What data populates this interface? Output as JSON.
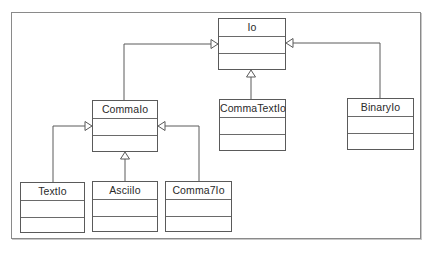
{
  "diagram": {
    "type": "uml-class-diagram",
    "frame": {
      "x": 11,
      "y": 12,
      "width": 410,
      "height": 227
    },
    "colors": {
      "line": "#5a5a5a",
      "frame": "#8a8a8a",
      "text": "#2a2a2a",
      "background": "#ffffff"
    },
    "classes": [
      {
        "id": "io",
        "name": "Io",
        "x": 218,
        "y": 18,
        "w": 68,
        "h": 52
      },
      {
        "id": "commaio",
        "name": "CommaIo",
        "x": 92,
        "y": 100,
        "w": 66,
        "h": 52
      },
      {
        "id": "commatextio",
        "name": "CommaTextIo",
        "x": 219,
        "y": 99,
        "w": 67,
        "h": 52
      },
      {
        "id": "binaryio",
        "name": "BinaryIo",
        "x": 347,
        "y": 98,
        "w": 67,
        "h": 52
      },
      {
        "id": "textio",
        "name": "TextIo",
        "x": 20,
        "y": 182,
        "w": 65,
        "h": 51
      },
      {
        "id": "asciiio",
        "name": "AsciiIo",
        "x": 92,
        "y": 181,
        "w": 66,
        "h": 51
      },
      {
        "id": "comma7io",
        "name": "Comma7Io",
        "x": 165,
        "y": 181,
        "w": 67,
        "h": 51
      }
    ],
    "generalizations": [
      {
        "child": "CommaIo",
        "parent": "Io",
        "points": [
          [
            124,
            100
          ],
          [
            124,
            44
          ],
          [
            218,
            44
          ]
        ],
        "arrow_dir": "right"
      },
      {
        "child": "CommaTextIo",
        "parent": "Io",
        "points": [
          [
            251,
            99
          ],
          [
            251,
            70
          ]
        ],
        "arrow_dir": "up"
      },
      {
        "child": "BinaryIo",
        "parent": "Io",
        "points": [
          [
            380,
            98
          ],
          [
            380,
            43
          ],
          [
            286,
            43
          ]
        ],
        "arrow_dir": "left"
      },
      {
        "child": "TextIo",
        "parent": "CommaIo",
        "points": [
          [
            53,
            182
          ],
          [
            53,
            126
          ],
          [
            92,
            126
          ]
        ],
        "arrow_dir": "right"
      },
      {
        "child": "AsciiIo",
        "parent": "CommaIo",
        "points": [
          [
            125,
            181
          ],
          [
            125,
            152
          ]
        ],
        "arrow_dir": "up"
      },
      {
        "child": "Comma7Io",
        "parent": "CommaIo",
        "points": [
          [
            199,
            181
          ],
          [
            199,
            126
          ],
          [
            158,
            126
          ]
        ],
        "arrow_dir": "left"
      }
    ]
  }
}
